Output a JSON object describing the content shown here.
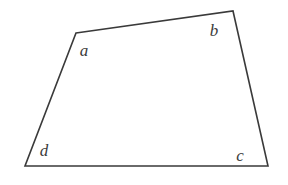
{
  "figure": {
    "type": "geometry-diagram",
    "shape": "quadrilateral",
    "background_color": "#ffffff",
    "stroke_color": "#3a3a3a",
    "stroke_width": 1.6,
    "label_color": "#3c3c3c",
    "label_style": "italic-serif",
    "label_font_size": 17,
    "canvas": {
      "width": 288,
      "height": 185
    },
    "vertices": [
      {
        "id": "a",
        "label": "a",
        "x": 76,
        "y": 33,
        "label_x": 84,
        "label_y": 56
      },
      {
        "id": "b",
        "label": "b",
        "x": 233,
        "y": 11,
        "label_x": 214,
        "label_y": 36
      },
      {
        "id": "c",
        "label": "c",
        "x": 268,
        "y": 166,
        "label_x": 240,
        "label_y": 161
      },
      {
        "id": "d",
        "label": "d",
        "x": 25,
        "y": 166,
        "label_x": 44,
        "label_y": 156
      }
    ],
    "edges": [
      {
        "id": "edge-ab",
        "from": "a",
        "to": "b"
      },
      {
        "id": "edge-bc",
        "from": "b",
        "to": "c"
      },
      {
        "id": "edge-cd",
        "from": "c",
        "to": "d"
      },
      {
        "id": "edge-da",
        "from": "d",
        "to": "a"
      }
    ],
    "polygon_points": "76,33 233,11 268,166 25,166"
  }
}
